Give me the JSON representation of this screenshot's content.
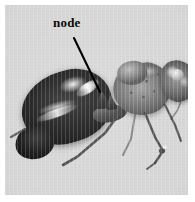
{
  "figure": {
    "kind": "photograph",
    "background_color": "#d4d4d4",
    "plate_border_color": "#ffffff",
    "caption": ""
  },
  "annotations": [
    {
      "id": "node",
      "label": "node",
      "label_color": "#0a0a0a",
      "leader_color": "#000000",
      "label_x": 53,
      "label_y": 16,
      "leader_start_x": 74,
      "leader_start_y": 38,
      "leader_end_x": 100,
      "leader_end_y": 92
    }
  ],
  "specimen": {
    "parts": [
      {
        "name": "gaster",
        "tone": "#0b0b0b"
      },
      {
        "name": "gaster-tip",
        "tone": "#080808"
      },
      {
        "name": "petiole",
        "tone": "#3a3a3a"
      },
      {
        "name": "node",
        "tone": "#1c1c1c"
      },
      {
        "name": "mesosoma",
        "tone": "#6a6a6a"
      },
      {
        "name": "pronotum",
        "tone": "#7d7d7d"
      },
      {
        "name": "head",
        "tone": "#5e5e5e"
      },
      {
        "name": "eye",
        "tone": "#c2c2c2"
      },
      {
        "name": "legs",
        "tone": "#3b3b3b"
      }
    ]
  }
}
